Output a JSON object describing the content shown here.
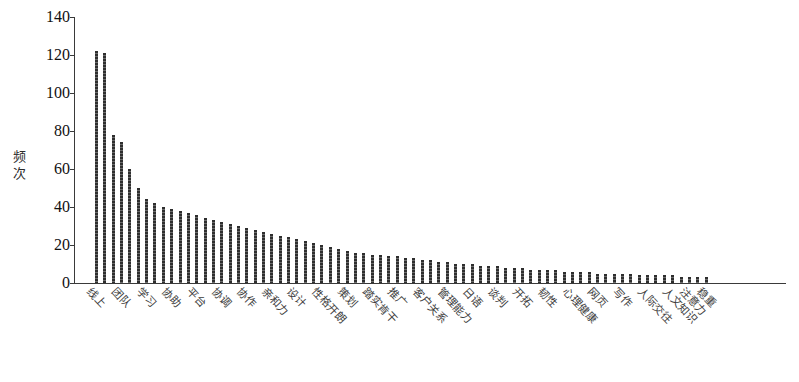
{
  "chart_data": {
    "type": "bar",
    "title": "",
    "subtitle": "",
    "xlabel": "",
    "ylabel": "频次",
    "ylim": [
      0,
      140
    ],
    "yticks": [
      0,
      20,
      40,
      60,
      80,
      100,
      120,
      140
    ],
    "grid": false,
    "legend": null,
    "categories": [
      "线上",
      "团队",
      "学习",
      "协助",
      "平台",
      "协调",
      "协作",
      "亲和力",
      "设计",
      "性格开朗",
      "策划",
      "踏实肯干",
      "推广",
      "客户关系",
      "管理能力",
      "日语",
      "谈判",
      "开拓",
      "韧性",
      "心理健康",
      "网页",
      "写作",
      "人际交往",
      "人文知识",
      "注意力",
      "稳重"
    ],
    "values": [
      122,
      121,
      78,
      74,
      60,
      50,
      44,
      42,
      40,
      39,
      38,
      37,
      36,
      34,
      33,
      32,
      31,
      30,
      29,
      28,
      27,
      26,
      25,
      24,
      23,
      22
    ],
    "all_categories": [
      "线上",
      "团队",
      "学习",
      "协助",
      "平台",
      "协调",
      "协作",
      "亲和力",
      "设计",
      "性格开朗",
      "策划",
      "踏实肯干",
      "推广",
      "客户关系",
      "管理能力",
      "日语",
      "谈判",
      "开拓",
      "韧性",
      "心理健康",
      "网页",
      "写作",
      "人际交往",
      "人文知识",
      "注意力",
      "稳重"
    ],
    "all_values": [
      122,
      121,
      78,
      74,
      60,
      50,
      44,
      42,
      40,
      39,
      38,
      37,
      36,
      34,
      33,
      32,
      31,
      30,
      29,
      28,
      27,
      26,
      25,
      24,
      23,
      22,
      21,
      20,
      19,
      18,
      17,
      16,
      16,
      15,
      15,
      14,
      14,
      13,
      13,
      12,
      12,
      11,
      11,
      10,
      10,
      10,
      9,
      9,
      9,
      8,
      8,
      8,
      7,
      7,
      7,
      7,
      6,
      6,
      6,
      6,
      5,
      5,
      5,
      5,
      5,
      4,
      4,
      4,
      4,
      4,
      3,
      3,
      3,
      3
    ],
    "label_positions": [
      0,
      3,
      6,
      9,
      12,
      15,
      18,
      21,
      24,
      27,
      30,
      33,
      36,
      39,
      42,
      45,
      48,
      51,
      54,
      57,
      60,
      63,
      66,
      69,
      71,
      73
    ],
    "bar_count": 74
  },
  "axis": {
    "y_label": "频次",
    "y_tick_labels": [
      "140",
      "120",
      "100",
      "80",
      "60",
      "40",
      "20",
      "0"
    ]
  }
}
